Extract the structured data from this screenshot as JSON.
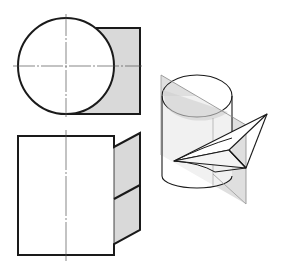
{
  "figure": {
    "views": [
      {
        "id": "top-view",
        "label": "Top view"
      },
      {
        "id": "front-view",
        "label": "Front view"
      },
      {
        "id": "isometric-view",
        "label": "Isometric view"
      }
    ],
    "colors": {
      "stroke": "#1a1a1a",
      "shade": "#d9d9d9",
      "plane_shade": "#dcdcdc",
      "centerline": "#555555",
      "background": "#ffffff"
    }
  }
}
